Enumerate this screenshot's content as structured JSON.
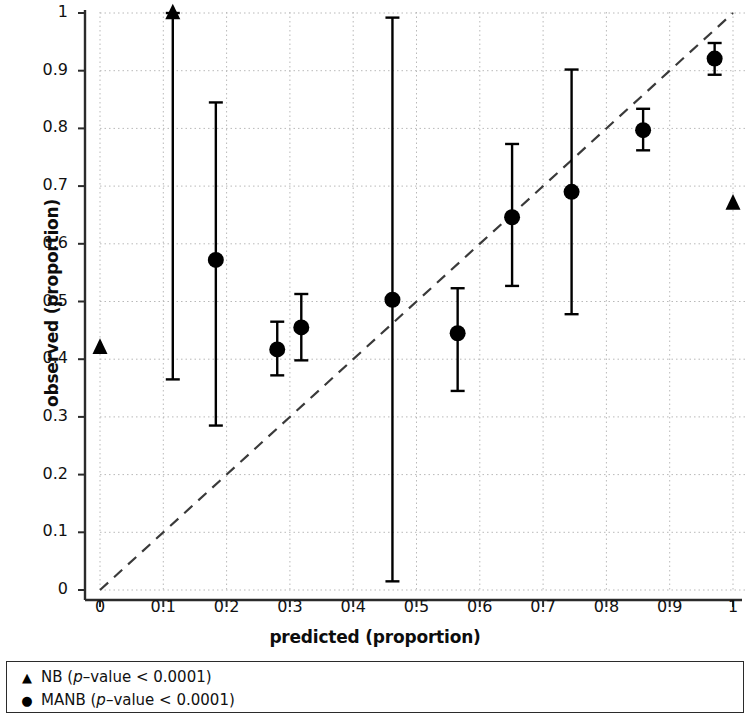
{
  "chart_data": {
    "type": "scatter",
    "title": "",
    "subtitle": "",
    "xlabel": "predicted (proportion)",
    "ylabel": "observed (proportion)",
    "xlim": [
      0,
      1
    ],
    "ylim": [
      0,
      1
    ],
    "xticks": [
      "0",
      "0.1",
      "0.2",
      "0.3",
      "0.4",
      "0.5",
      "0.6",
      "0.7",
      "0.8",
      "0.9",
      "1"
    ],
    "xtick_values": [
      0,
      0.1,
      0.2,
      0.3,
      0.4,
      0.5,
      0.6,
      0.7,
      0.8,
      0.9,
      1
    ],
    "yticks": [
      "0",
      "0.1",
      "0.2",
      "0.3",
      "0.4",
      "0.5",
      "0.6",
      "0.7",
      "0.8",
      "0.9",
      "1"
    ],
    "ytick_values": [
      0,
      0.1,
      0.2,
      0.3,
      0.4,
      0.5,
      0.6,
      0.7,
      0.8,
      0.9,
      1
    ],
    "grid": true,
    "grid_style": "dotted",
    "grid_color": "#b9b9b9",
    "reference_line": {
      "name": "perfect-calibration-diagonal",
      "style": "dashed",
      "color": "#3a3a3a",
      "x": [
        0,
        1
      ],
      "y": [
        0,
        1
      ]
    },
    "legend_position": "below-axes",
    "series": [
      {
        "name": "NB (p-value < 0.0001)",
        "short_name": "NB",
        "marker": "triangle",
        "color": "#000000",
        "points": [
          {
            "x": 0.0,
            "y": 0.42,
            "ylow": null,
            "yhigh": null
          },
          {
            "x": 0.115,
            "y": 1.0,
            "ylow": 0.365,
            "yhigh": 1.0
          },
          {
            "x": 1.0,
            "y": 0.67,
            "ylow": null,
            "yhigh": null
          }
        ]
      },
      {
        "name": "MANB (p-value < 0.0001)",
        "short_name": "MANB",
        "marker": "circle",
        "color": "#000000",
        "points": [
          {
            "x": 0.183,
            "y": 0.572,
            "ylow": 0.285,
            "yhigh": 0.845
          },
          {
            "x": 0.28,
            "y": 0.417,
            "ylow": 0.372,
            "yhigh": 0.465
          },
          {
            "x": 0.318,
            "y": 0.455,
            "ylow": 0.398,
            "yhigh": 0.513
          },
          {
            "x": 0.462,
            "y": 0.503,
            "ylow": 0.015,
            "yhigh": 0.992
          },
          {
            "x": 0.565,
            "y": 0.445,
            "ylow": 0.345,
            "yhigh": 0.523
          },
          {
            "x": 0.651,
            "y": 0.646,
            "ylow": 0.527,
            "yhigh": 0.773
          },
          {
            "x": 0.745,
            "y": 0.69,
            "ylow": 0.478,
            "yhigh": 0.902
          },
          {
            "x": 0.858,
            "y": 0.797,
            "ylow": 0.762,
            "yhigh": 0.834
          },
          {
            "x": 0.971,
            "y": 0.921,
            "ylow": 0.893,
            "yhigh": 0.948
          }
        ]
      }
    ]
  },
  "axes": {
    "xlabel": "predicted (proportion)",
    "ylabel": "observed (proportion)"
  },
  "legend": {
    "nb": {
      "marker": "▲",
      "prefix": "NB (",
      "italic": "p",
      "suffix": "–value < 0.0001)"
    },
    "manb": {
      "marker": "●",
      "prefix": "MANB (",
      "italic": "p",
      "suffix": "–value < 0.0001)"
    }
  }
}
